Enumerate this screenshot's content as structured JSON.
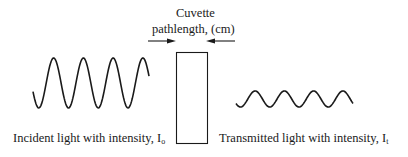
{
  "diagram": {
    "title_line1": "Cuvette",
    "title_line2": "pathlength, (cm)",
    "incident": {
      "label": "Incident light with intensity, I",
      "subscript": "o",
      "periods": 4,
      "amplitude_px": 25
    },
    "transmitted": {
      "label": "Transmitted light with intensity, I",
      "subscript": "t",
      "periods": 4,
      "amplitude_px": 8
    },
    "colors": {
      "stroke": "#1a1a1a",
      "background": "#ffffff"
    }
  }
}
